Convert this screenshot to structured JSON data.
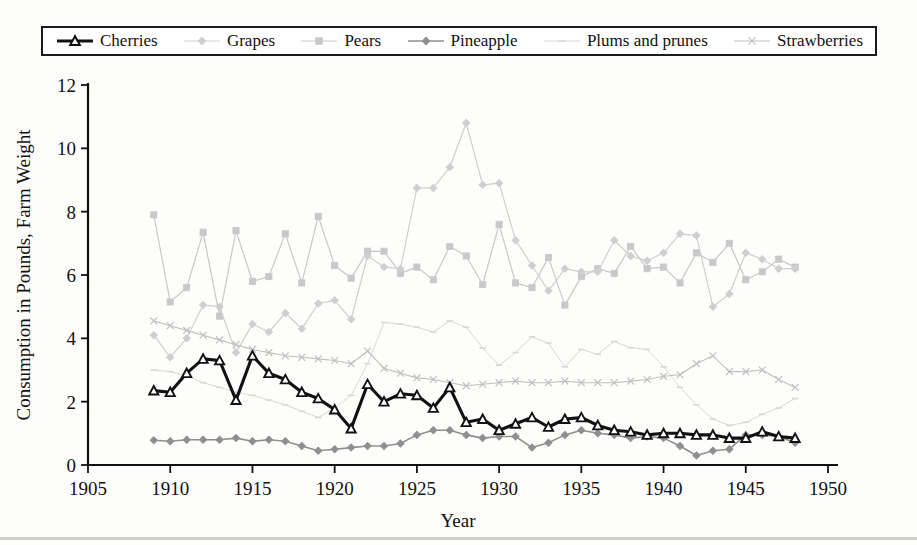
{
  "scan_artifact_text": "",
  "legend": {
    "items": [
      {
        "label": "Cherries",
        "key": "cherries",
        "color": "#111111",
        "marker": "triangle",
        "width": 3.1
      },
      {
        "label": "Grapes",
        "key": "grapes",
        "color": "#cfcfcf",
        "marker": "diamond",
        "width": 1.2
      },
      {
        "label": "Pears",
        "key": "pears",
        "color": "#c8c8c8",
        "marker": "square",
        "width": 1.2
      },
      {
        "label": "Pineapple",
        "key": "pineapple",
        "color": "#8f8f8f",
        "marker": "diamond",
        "width": 1.6
      },
      {
        "label": "Plums and prunes",
        "key": "plums",
        "color": "#d8d8d8",
        "marker": "dash",
        "width": 1.0
      },
      {
        "label": "Strawberries",
        "key": "strawberries",
        "color": "#c0c0c0",
        "marker": "x",
        "width": 1.1
      }
    ]
  },
  "chart_data": {
    "type": "line",
    "title": "",
    "xlabel": "Year",
    "ylabel": "Consumption in Pounds, Farm Weight",
    "xlim": [
      1905,
      1950
    ],
    "ylim": [
      0,
      12
    ],
    "xticks": [
      1905,
      1910,
      1915,
      1920,
      1925,
      1930,
      1935,
      1940,
      1945,
      1950
    ],
    "yticks": [
      0,
      2,
      4,
      6,
      8,
      10,
      12
    ],
    "grid": false,
    "legend_position": "top",
    "x": [
      1909,
      1910,
      1911,
      1912,
      1913,
      1914,
      1915,
      1916,
      1917,
      1918,
      1919,
      1920,
      1921,
      1922,
      1923,
      1924,
      1925,
      1926,
      1927,
      1928,
      1929,
      1930,
      1931,
      1932,
      1933,
      1934,
      1935,
      1936,
      1937,
      1938,
      1939,
      1940,
      1941,
      1942,
      1943,
      1944,
      1945,
      1946,
      1947,
      1948
    ],
    "series": [
      {
        "name": "Cherries",
        "values": [
          2.35,
          2.3,
          2.9,
          3.35,
          3.3,
          2.05,
          3.45,
          2.9,
          2.7,
          2.3,
          2.1,
          1.75,
          1.15,
          2.55,
          2.0,
          2.25,
          2.2,
          1.8,
          2.45,
          1.35,
          1.45,
          1.1,
          1.3,
          1.5,
          1.2,
          1.45,
          1.5,
          1.25,
          1.1,
          1.05,
          0.95,
          1.0,
          1.0,
          0.95,
          0.95,
          0.85,
          0.85,
          1.05,
          0.9,
          0.85
        ]
      },
      {
        "name": "Grapes",
        "values": [
          4.1,
          3.4,
          4.0,
          5.05,
          5.0,
          3.55,
          4.45,
          4.2,
          4.8,
          4.3,
          5.1,
          5.2,
          4.6,
          6.6,
          6.25,
          6.2,
          8.75,
          8.75,
          9.4,
          10.8,
          8.85,
          8.9,
          7.1,
          6.3,
          5.5,
          6.2,
          6.1,
          6.1,
          7.1,
          6.6,
          6.45,
          6.7,
          7.3,
          7.25,
          5.0,
          5.4,
          6.7,
          6.5,
          6.2,
          6.2
        ]
      },
      {
        "name": "Pears",
        "values": [
          7.9,
          5.15,
          5.6,
          7.35,
          4.7,
          7.4,
          5.8,
          5.95,
          7.3,
          5.75,
          7.85,
          6.3,
          5.9,
          6.75,
          6.75,
          6.05,
          6.25,
          5.85,
          6.9,
          6.6,
          5.7,
          7.6,
          5.75,
          5.6,
          6.55,
          5.05,
          5.95,
          6.2,
          6.05,
          6.9,
          6.2,
          6.25,
          5.75,
          6.7,
          6.4,
          7.0,
          5.85,
          6.1,
          6.5,
          6.25
        ]
      },
      {
        "name": "Pineapple",
        "values": [
          0.78,
          0.75,
          0.8,
          0.8,
          0.8,
          0.85,
          0.75,
          0.8,
          0.75,
          0.6,
          0.45,
          0.5,
          0.55,
          0.6,
          0.6,
          0.68,
          0.95,
          1.1,
          1.1,
          0.95,
          0.85,
          0.9,
          0.9,
          0.55,
          0.7,
          0.95,
          1.1,
          1.0,
          0.95,
          0.85,
          0.9,
          0.85,
          0.6,
          0.3,
          0.45,
          0.5,
          0.95,
          0.95,
          0.9,
          0.7
        ]
      },
      {
        "name": "Plums and prunes",
        "values": [
          3.0,
          2.95,
          2.8,
          2.6,
          2.45,
          2.3,
          2.2,
          2.05,
          1.9,
          1.7,
          1.5,
          1.8,
          2.2,
          3.2,
          4.5,
          4.45,
          4.35,
          4.2,
          4.55,
          4.35,
          3.7,
          3.15,
          3.55,
          4.05,
          3.85,
          3.1,
          3.65,
          3.5,
          3.9,
          3.7,
          3.65,
          3.1,
          2.45,
          1.9,
          1.45,
          1.25,
          1.35,
          1.6,
          1.8,
          2.1
        ]
      },
      {
        "name": "Strawberries",
        "values": [
          4.55,
          4.4,
          4.25,
          4.1,
          3.95,
          3.8,
          3.65,
          3.55,
          3.45,
          3.4,
          3.35,
          3.3,
          3.2,
          3.6,
          3.05,
          2.9,
          2.75,
          2.7,
          2.6,
          2.5,
          2.55,
          2.6,
          2.65,
          2.6,
          2.6,
          2.65,
          2.6,
          2.6,
          2.6,
          2.65,
          2.7,
          2.8,
          2.85,
          3.2,
          3.45,
          2.95,
          2.95,
          3.0,
          2.7,
          2.45
        ]
      }
    ]
  }
}
